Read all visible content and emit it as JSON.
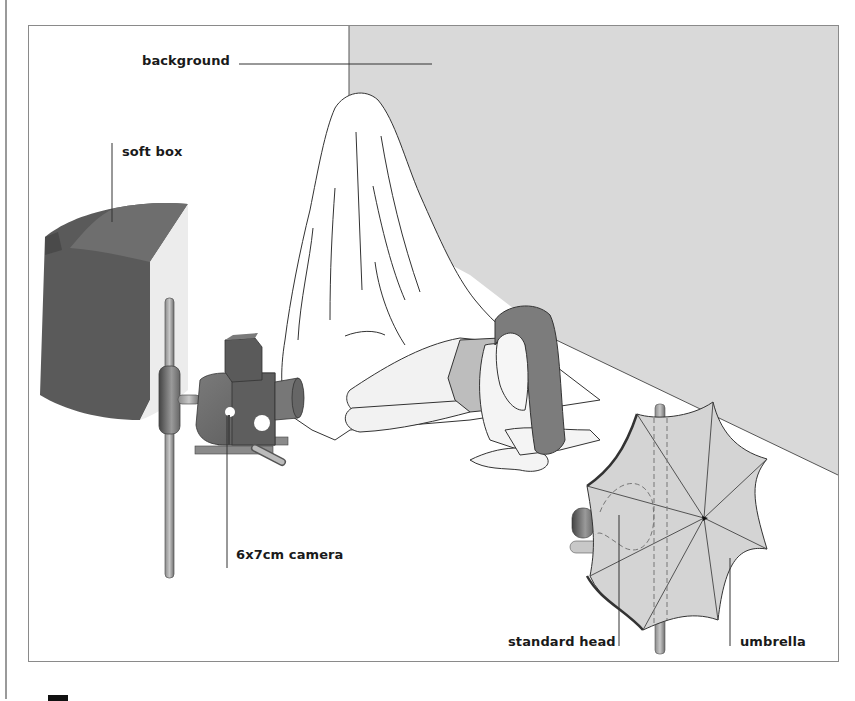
{
  "diagram": {
    "labels": {
      "background": "background",
      "soft_box": "soft box",
      "camera": "6x7cm camera",
      "standard_head": "standard head",
      "umbrella": "umbrella"
    },
    "colors": {
      "background_panel": "#d9d9d9",
      "softbox_dark": "#5a5a5a",
      "softbox_light": "#ececec",
      "camera_body": "#6a6a6a",
      "hair": "#7c7c7c",
      "umbrella_fill": "#d4d4d4",
      "line": "#333333",
      "frame_border": "#8a8a8a"
    }
  }
}
